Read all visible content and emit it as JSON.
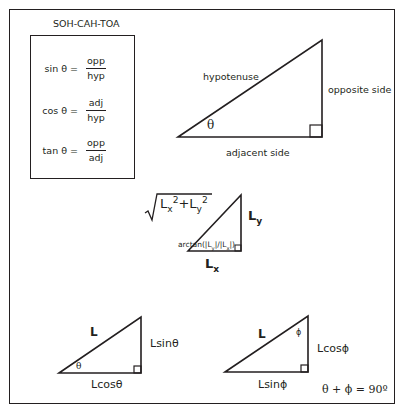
{
  "soh_cah_toa": {
    "title": "SOH-CAH-TOA",
    "formulas": [
      {
        "lhs": "sin θ =",
        "numerator": "opp",
        "denominator": "hyp"
      },
      {
        "lhs": "cos θ =",
        "numerator": "adj",
        "denominator": "hyp"
      },
      {
        "lhs": "tan θ =",
        "numerator": "opp",
        "denominator": "adj"
      }
    ]
  },
  "main_triangle": {
    "hypotenuse": "hypotenuse",
    "opposite": "opposite side",
    "adjacent": "adjacent side",
    "angle": "θ"
  },
  "component_triangle": {
    "magnitude_L": "L",
    "magnitude_x": "x",
    "magnitude_plus": "+L",
    "magnitude_y": "y",
    "exp": "2",
    "side_L": "L",
    "side_y_sub": "y",
    "side_x_sub": "x",
    "angle_label": "arctan(|L",
    "angle_label_sub1": "y",
    "angle_label_mid": "|/|L",
    "angle_label_sub2": "x",
    "angle_label_end": "|)"
  },
  "theta_triangle": {
    "hyp": "L",
    "opposite": "Lsinθ",
    "adjacent": "Lcosθ",
    "angle": "θ"
  },
  "phi_triangle": {
    "hyp": "L",
    "opposite": "Lcosϕ",
    "adjacent": "Lsinϕ",
    "angle": "ϕ"
  },
  "identity": "θ + ϕ = 90º"
}
